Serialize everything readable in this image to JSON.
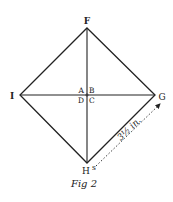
{
  "figure": {
    "caption": "Fig 2",
    "stroke_color": "#222222",
    "background": "#ffffff"
  },
  "vertices": {
    "top": {
      "label": "F",
      "x": 87,
      "y": 28
    },
    "left": {
      "label": "I",
      "x": 20,
      "y": 95
    },
    "right": {
      "label": "G",
      "x": 155,
      "y": 95
    },
    "bottom": {
      "label": "H",
      "x": 87,
      "y": 163
    }
  },
  "center_labels": {
    "top_left": "A",
    "top_right": "B",
    "bottom_left": "D",
    "bottom_right": "C"
  },
  "bottom_superscript": "s",
  "measurement": {
    "label": "3½ in.",
    "from": "H",
    "to": "G",
    "style": "dotted-arrow"
  }
}
